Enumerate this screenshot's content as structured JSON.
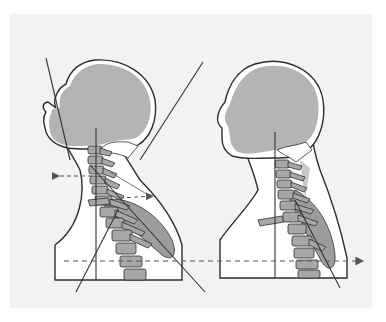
{
  "diagram": {
    "panels": [
      {
        "id": "forward-head-posture",
        "position": "left"
      },
      {
        "id": "neutral-posture",
        "position": "right"
      }
    ],
    "colors": {
      "background": "#f2f2f2",
      "margin": "#ffffff",
      "skull_fill": "#b4b4b4",
      "body_fill": "#ffffff",
      "outline": "#2e2e2e",
      "vertebra_fill": "#a7a7a7",
      "muscle_fill": "#9c9c9c",
      "guide_line": "#333333",
      "dashed_arrow": "#555555"
    }
  }
}
